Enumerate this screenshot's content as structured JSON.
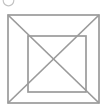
{
  "canvas": {
    "width": 108,
    "height": 106,
    "background": "#ffffff"
  },
  "figure": {
    "default_stroke_color": "#9b9b9b",
    "default_stroke_width": 1.7,
    "shapes": [
      {
        "name": "option-circle-marker",
        "type": "circle",
        "interactable": "true",
        "cx": 8.5,
        "cy": 0.5,
        "r": 5.3,
        "stroke": "#c4c4c4",
        "stroke_width": 1.2
      },
      {
        "name": "outer-square",
        "type": "rect",
        "interactable": "false",
        "x": 8,
        "y": 15,
        "width": 91,
        "height": 88
      },
      {
        "name": "inner-square",
        "type": "rect",
        "interactable": "false",
        "x": 28,
        "y": 36,
        "width": 58,
        "height": 56
      },
      {
        "name": "diagonal-topleft-bottomright",
        "type": "line",
        "interactable": "false",
        "x1": 8,
        "y1": 15,
        "x2": 99,
        "y2": 103
      },
      {
        "name": "diagonal-topright-bottomleft",
        "type": "line",
        "interactable": "false",
        "x1": 99,
        "y1": 15,
        "x2": 8,
        "y2": 103
      }
    ]
  }
}
